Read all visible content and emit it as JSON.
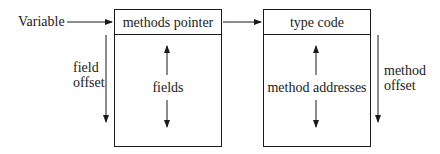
{
  "diagram": {
    "variable_label": "Variable",
    "left_box": {
      "header": "methods pointer",
      "body": "fields"
    },
    "right_box": {
      "header": "type code",
      "body": "method addresses"
    },
    "left_offset": {
      "line1": "field",
      "line2": "offset"
    },
    "right_offset": {
      "line1": "method",
      "line2": "offset"
    },
    "colors": {
      "stroke": "#1a1a1a",
      "background": "#ffffff"
    }
  }
}
